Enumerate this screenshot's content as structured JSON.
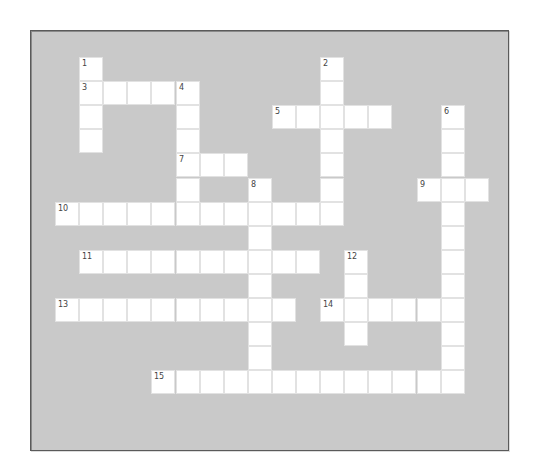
{
  "puzzle": {
    "grid_origin": {
      "x": 55,
      "y": 57
    },
    "cell_size": 24.1,
    "colors": {
      "background": "#c9c9c9",
      "cell": "#ffffff",
      "cell_border": "#e2e2e2",
      "panel_border": "#5a5a5a",
      "number": "#444444"
    },
    "words": [
      {
        "number": "1",
        "direction": "down",
        "row": 0,
        "col": 1,
        "length": 4
      },
      {
        "number": "2",
        "direction": "down",
        "row": 0,
        "col": 11,
        "length": 7
      },
      {
        "number": "3",
        "direction": "across",
        "row": 1,
        "col": 1,
        "length": 5
      },
      {
        "number": "4",
        "direction": "down",
        "row": 1,
        "col": 5,
        "length": 5
      },
      {
        "number": "5",
        "direction": "across",
        "row": 2,
        "col": 9,
        "length": 5
      },
      {
        "number": "6",
        "direction": "down",
        "row": 2,
        "col": 16,
        "length": 12
      },
      {
        "number": "7",
        "direction": "across",
        "row": 4,
        "col": 5,
        "length": 3
      },
      {
        "number": "8",
        "direction": "down",
        "row": 5,
        "col": 8,
        "length": 9
      },
      {
        "number": "9",
        "direction": "across",
        "row": 5,
        "col": 15,
        "length": 3
      },
      {
        "number": "10",
        "direction": "across",
        "row": 6,
        "col": 0,
        "length": 12
      },
      {
        "number": "11",
        "direction": "across",
        "row": 8,
        "col": 1,
        "length": 10
      },
      {
        "number": "12",
        "direction": "down",
        "row": 8,
        "col": 12,
        "length": 4
      },
      {
        "number": "13",
        "direction": "across",
        "row": 10,
        "col": 0,
        "length": 10
      },
      {
        "number": "14",
        "direction": "across",
        "row": 10,
        "col": 11,
        "length": 6
      },
      {
        "number": "15",
        "direction": "across",
        "row": 13,
        "col": 4,
        "length": 13
      }
    ]
  }
}
